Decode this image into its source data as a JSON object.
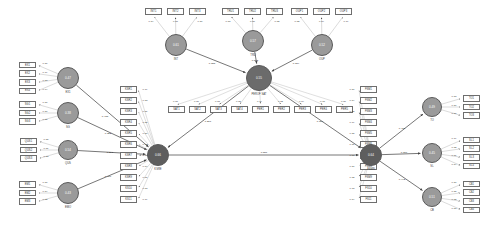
{
  "diagram": {
    "type": "sem-path-diagram",
    "colors": {
      "indicator_fill": "#ffffff",
      "indicator_stroke": "#6e6e6e",
      "latent_mid": "#9a9a9a",
      "latent_dark": "#6b6b6b",
      "latent_hub": "#5e5e5e",
      "path_stroke": "#555555",
      "loading_stroke": "#a8a8a8",
      "text": "#2a2a2a"
    }
  },
  "latents": [
    {
      "id": "L1",
      "label": "EX1",
      "value": "0.47",
      "x": 68,
      "y": 78,
      "r": 11,
      "shade": "mid"
    },
    {
      "id": "L2",
      "label": "SG",
      "value": "0.38",
      "x": 68,
      "y": 113,
      "r": 11,
      "shade": "mid"
    },
    {
      "id": "L3",
      "label": "QUS",
      "value": "0.54",
      "x": 68,
      "y": 150,
      "r": 10,
      "shade": "mid"
    },
    {
      "id": "L4",
      "label": "EMO",
      "value": "0.43",
      "x": 68,
      "y": 193,
      "r": 11,
      "shade": "mid"
    },
    {
      "id": "T1",
      "label": "INT",
      "value": "0.61",
      "x": 176,
      "y": 45,
      "r": 11,
      "shade": "mid"
    },
    {
      "id": "T2",
      "label": "TRU",
      "value": "0.57",
      "x": 253,
      "y": 41,
      "r": 11,
      "shade": "mid"
    },
    {
      "id": "T3",
      "label": "OUP",
      "value": "0.52",
      "x": 322,
      "y": 45,
      "r": 11,
      "shade": "mid"
    },
    {
      "id": "M1",
      "label": "PEROF\\nSAT",
      "value": "0.55",
      "x": 259,
      "y": 78,
      "r": 13,
      "shade": "dark"
    },
    {
      "id": "H1",
      "label": "KSRE",
      "value": "0.66",
      "x": 158,
      "y": 155,
      "r": 11,
      "shade": "hub"
    },
    {
      "id": "H2",
      "label": "FSMN",
      "value": "0.64",
      "x": 371,
      "y": 155,
      "r": 11,
      "shade": "hub"
    },
    {
      "id": "R1",
      "label": "TO",
      "value": "0.49",
      "x": 432,
      "y": 107,
      "r": 10,
      "shade": "mid"
    },
    {
      "id": "R2",
      "label": "SL",
      "value": "0.45",
      "x": 432,
      "y": 153,
      "r": 10,
      "shade": "mid"
    },
    {
      "id": "R3",
      "label": "CB",
      "value": "0.51",
      "x": 432,
      "y": 197,
      "r": 10,
      "shade": "mid"
    }
  ],
  "indicator_groups": [
    {
      "owner": "L1",
      "side": "left",
      "items": [
        {
          "label": "EX1",
          "loading": "0.86"
        },
        {
          "label": "EX2",
          "loading": "0.79"
        },
        {
          "label": "EX3",
          "loading": "0.83"
        },
        {
          "label": "EX4",
          "loading": "0.74"
        }
      ]
    },
    {
      "owner": "L2",
      "side": "left",
      "items": [
        {
          "label": "SG1",
          "loading": "0.87"
        },
        {
          "label": "SG2",
          "loading": "0.80"
        },
        {
          "label": "SG3",
          "loading": "0.85"
        }
      ]
    },
    {
      "owner": "L3",
      "side": "left",
      "items": [
        {
          "label": "QUS1",
          "loading": "0.85"
        },
        {
          "label": "QUS2",
          "loading": "0.81"
        },
        {
          "label": "QUS3",
          "loading": "0.88"
        }
      ]
    },
    {
      "owner": "L4",
      "side": "left",
      "items": [
        {
          "label": "EM1",
          "loading": "0.87"
        },
        {
          "label": "EM2",
          "loading": "0.84"
        },
        {
          "label": "EM3",
          "loading": "0.82"
        }
      ]
    },
    {
      "owner": "T1",
      "side": "top",
      "items": [
        {
          "label": "INT1",
          "loading": "0.84"
        },
        {
          "label": "INT2",
          "loading": "0.87"
        },
        {
          "label": "INT3",
          "loading": "0.80"
        }
      ]
    },
    {
      "owner": "T2",
      "side": "top",
      "items": [
        {
          "label": "TRU1",
          "loading": "0.83"
        },
        {
          "label": "TRU2",
          "loading": "0.86"
        },
        {
          "label": "TRU3",
          "loading": "0.82"
        }
      ]
    },
    {
      "owner": "T3",
      "side": "top",
      "items": [
        {
          "label": "OUP1",
          "loading": "0.82"
        },
        {
          "label": "OUP2",
          "loading": "0.84"
        },
        {
          "label": "OUP3",
          "loading": "0.79"
        }
      ]
    },
    {
      "owner": "M1",
      "side": "bottom",
      "items": [
        {
          "label": "SAT1",
          "loading": "0.81"
        },
        {
          "label": "SAT2",
          "loading": "0.80"
        },
        {
          "label": "SAT3",
          "loading": "0.83"
        },
        {
          "label": "SAT4",
          "loading": "0.85"
        },
        {
          "label": "PER1",
          "loading": "0.79"
        },
        {
          "label": "PER2",
          "loading": "0.82"
        },
        {
          "label": "PER3",
          "loading": "0.84"
        },
        {
          "label": "PER4",
          "loading": "0.78"
        },
        {
          "label": "PER5",
          "loading": "0.80"
        }
      ]
    },
    {
      "owner": "H1",
      "side": "hub-left",
      "items": [
        {
          "label": "KSR1",
          "loading": "0.79"
        },
        {
          "label": "KSR2",
          "loading": "0.83"
        },
        {
          "label": "KSR3",
          "loading": "0.81"
        },
        {
          "label": "KSR4",
          "loading": "0.85"
        },
        {
          "label": "KSR5",
          "loading": "0.80"
        },
        {
          "label": "KSR6",
          "loading": "0.82"
        },
        {
          "label": "KSR7",
          "loading": "0.78"
        },
        {
          "label": "KSR8",
          "loading": "0.84"
        },
        {
          "label": "KSR9",
          "loading": "0.81"
        },
        {
          "label": "KS10",
          "loading": "0.83"
        },
        {
          "label": "KS11",
          "loading": "0.79"
        }
      ]
    },
    {
      "owner": "H2",
      "side": "hub-right",
      "items": [
        {
          "label": "FSM1",
          "loading": "0.80"
        },
        {
          "label": "FSM2",
          "loading": "0.84"
        },
        {
          "label": "FSM3",
          "loading": "0.82"
        },
        {
          "label": "FSM4",
          "loading": "0.79"
        },
        {
          "label": "FSM5",
          "loading": "0.85"
        },
        {
          "label": "FSM6",
          "loading": "0.81"
        },
        {
          "label": "FSM7",
          "loading": "0.83"
        },
        {
          "label": "FSM8",
          "loading": "0.80"
        },
        {
          "label": "FSM9",
          "loading": "0.82"
        },
        {
          "label": "FS10",
          "loading": "0.78"
        },
        {
          "label": "FS11",
          "loading": "0.84"
        }
      ]
    },
    {
      "owner": "R1",
      "side": "right",
      "items": [
        {
          "label": "TO1",
          "loading": "0.83"
        },
        {
          "label": "TO2",
          "loading": "0.80"
        },
        {
          "label": "TO3",
          "loading": "0.86"
        }
      ]
    },
    {
      "owner": "R2",
      "side": "right",
      "items": [
        {
          "label": "SL1",
          "loading": "0.79"
        },
        {
          "label": "SL2",
          "loading": "0.82"
        },
        {
          "label": "SL3",
          "loading": "0.81"
        },
        {
          "label": "SL4",
          "loading": "0.84"
        }
      ]
    },
    {
      "owner": "R3",
      "side": "right",
      "items": [
        {
          "label": "CB1",
          "loading": "0.80"
        },
        {
          "label": "CB2",
          "loading": "0.85"
        },
        {
          "label": "CB3",
          "loading": "0.82"
        },
        {
          "label": "CB4",
          "loading": "0.83"
        }
      ]
    }
  ],
  "structural_paths": [
    {
      "from": "L1",
      "to": "H1",
      "coef": "0.438",
      "lx": 105,
      "ly": 116
    },
    {
      "from": "L2",
      "to": "H1",
      "coef": "0.352",
      "lx": 108,
      "ly": 133
    },
    {
      "from": "L3",
      "to": "H1",
      "coef": "0.291",
      "lx": 110,
      "ly": 152
    },
    {
      "from": "L4",
      "to": "H1",
      "coef": "0.406",
      "lx": 108,
      "ly": 176
    },
    {
      "from": "T1",
      "to": "M1",
      "coef": "0.388",
      "lx": 212,
      "ly": 63
    },
    {
      "from": "T2",
      "to": "M1",
      "coef": "0.502",
      "lx": 255,
      "ly": 60
    },
    {
      "from": "T3",
      "to": "M1",
      "coef": "0.334",
      "lx": 296,
      "ly": 63
    },
    {
      "from": "M1",
      "to": "H1",
      "coef": "0.267",
      "lx": 208,
      "ly": 121
    },
    {
      "from": "M1",
      "to": "H2",
      "coef": "0.319",
      "lx": 320,
      "ly": 121
    },
    {
      "from": "H1",
      "to": "H2",
      "coef": "0.587",
      "lx": 264,
      "ly": 152
    },
    {
      "from": "H2",
      "to": "R1",
      "coef": "0.415",
      "lx": 402,
      "ly": 128
    },
    {
      "from": "H2",
      "to": "R2",
      "coef": "0.376",
      "lx": 404,
      "ly": 152
    },
    {
      "from": "H2",
      "to": "R3",
      "coef": "0.442",
      "lx": 402,
      "ly": 179
    }
  ]
}
